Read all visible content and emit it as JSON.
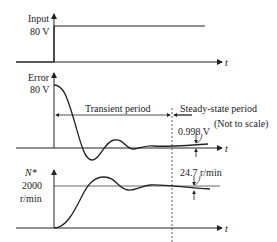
{
  "panels": {
    "input": {
      "label": "Input",
      "value": "80 V"
    },
    "error": {
      "label": "Error",
      "value": "80 V",
      "steady_value": "0.998 V"
    },
    "speed": {
      "label": "N*",
      "value": "2000",
      "unit": "r/min",
      "ripple": "24.7 r/min"
    }
  },
  "axis_label": "t",
  "periods": {
    "transient": "Transient period",
    "steady": "Steady-state period",
    "note": "(Not to scale)"
  },
  "colors": {
    "line": "#222222",
    "ref": "#444444"
  }
}
